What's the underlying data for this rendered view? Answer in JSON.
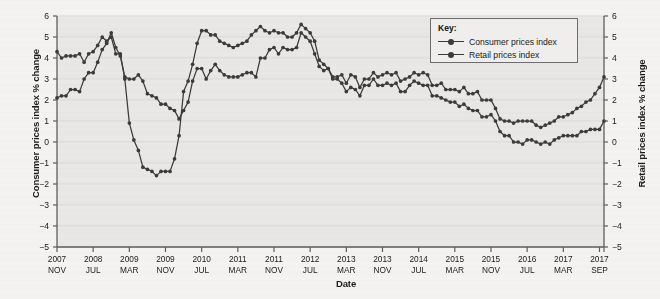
{
  "axes": {
    "y_left_title": "Consumer prices index % change",
    "y_right_title": "Retail prices index % change",
    "x_title": "Date"
  },
  "legend": {
    "title": "Key:",
    "entries": [
      {
        "label": "Consumer prices index"
      },
      {
        "label": "Retail prices index"
      }
    ]
  },
  "colors": {
    "line": "#3b3b3b",
    "plot_background": "#e9e8e6",
    "gridline": "#dcdbd8",
    "axis": "#5e5e5e",
    "text": "#1b1b1b",
    "page_background": "#f4f3f1"
  },
  "chart_data": {
    "type": "line",
    "title": "",
    "xlabel": "Date",
    "ylabel": "Consumer prices index % change",
    "ylabel_right": "Retail prices index % change",
    "ylim": [
      -5,
      6
    ],
    "ytick_values": [
      6,
      5,
      4,
      3,
      2,
      1,
      0,
      -1,
      -2,
      -3,
      -4,
      -5
    ],
    "ytick_labels": [
      "6",
      "5",
      "4",
      "3",
      "2",
      "1",
      "0",
      "−1",
      "−2",
      "−3",
      "−4",
      "−5"
    ],
    "ytick_labels_right": [
      "6",
      "5",
      "4",
      "3",
      "2",
      "1",
      "0",
      "−1",
      "−2",
      "−3",
      "−4",
      "−5"
    ],
    "grid": true,
    "legend_position": "top-right",
    "xtick_labels": [
      {
        "year": "2007",
        "month": "NOV"
      },
      {
        "year": "2008",
        "month": "JUL"
      },
      {
        "year": "2009",
        "month": "MAR"
      },
      {
        "year": "2009",
        "month": "NOV"
      },
      {
        "year": "2010",
        "month": "JUL"
      },
      {
        "year": "2011",
        "month": "MAR"
      },
      {
        "year": "2011",
        "month": "NOV"
      },
      {
        "year": "2012",
        "month": "JUL"
      },
      {
        "year": "2013",
        "month": "MAR"
      },
      {
        "year": "2013",
        "month": "NOV"
      },
      {
        "year": "2014",
        "month": "JUL"
      },
      {
        "year": "2015",
        "month": "MAR"
      },
      {
        "year": "2015",
        "month": "NOV"
      },
      {
        "year": "2016",
        "month": "JUL"
      },
      {
        "year": "2017",
        "month": "MAR"
      },
      {
        "year": "2017",
        "month": "SEP"
      }
    ],
    "x_start": "2007 NOV",
    "x_end": "2017 SEP",
    "x_interval_months": 1,
    "xtick_interval_months": 8,
    "n_points": 119,
    "series": [
      {
        "name": "Consumer prices index",
        "values": [
          2.1,
          2.2,
          2.2,
          2.5,
          2.5,
          2.4,
          3.0,
          3.3,
          3.3,
          3.8,
          4.4,
          4.7,
          5.2,
          4.5,
          4.1,
          3.1,
          3.0,
          3.0,
          3.2,
          2.9,
          2.3,
          2.2,
          2.1,
          1.8,
          1.8,
          1.6,
          1.5,
          1.1,
          1.5,
          1.9,
          2.9,
          3.5,
          3.5,
          3.0,
          3.4,
          3.7,
          3.4,
          3.2,
          3.1,
          3.1,
          3.1,
          3.2,
          3.3,
          3.3,
          3.1,
          4.0,
          4.0,
          4.4,
          4.5,
          4.2,
          4.5,
          4.4,
          4.4,
          4.5,
          5.2,
          5.0,
          4.8,
          4.2,
          3.6,
          3.4,
          3.5,
          3.0,
          3.0,
          2.8,
          2.4,
          2.6,
          2.5,
          2.2,
          2.7,
          2.7,
          3.0,
          2.7,
          2.7,
          2.8,
          2.7,
          2.8,
          2.4,
          2.4,
          2.7,
          2.9,
          2.8,
          2.7,
          2.7,
          2.2,
          2.2,
          2.1,
          2.0,
          1.9,
          1.9,
          1.7,
          1.8,
          1.6,
          1.5,
          1.5,
          1.2,
          1.2,
          1.3,
          1.0,
          0.5,
          0.3,
          0.3,
          0.0,
          0.0,
          -0.1,
          0.1,
          0.1,
          0.0,
          -0.1,
          0.0,
          -0.1,
          0.1,
          0.2,
          0.3,
          0.3,
          0.3,
          0.3,
          0.5,
          0.5,
          0.6,
          0.6,
          0.6,
          1.0
        ]
      },
      {
        "name": "Retail prices index",
        "values": [
          4.3,
          4.0,
          4.1,
          4.1,
          4.1,
          4.2,
          3.8,
          4.2,
          4.3,
          4.6,
          5.0,
          4.8,
          5.0,
          4.2,
          4.2,
          3.0,
          0.9,
          0.1,
          -0.4,
          -1.2,
          -1.3,
          -1.4,
          -1.6,
          -1.4,
          -1.4,
          -1.4,
          -0.8,
          0.3,
          2.4,
          2.9,
          3.7,
          4.7,
          5.3,
          5.3,
          5.1,
          5.1,
          4.8,
          4.7,
          4.6,
          4.5,
          4.6,
          4.7,
          4.8,
          5.1,
          5.3,
          5.5,
          5.3,
          5.2,
          5.3,
          5.2,
          5.2,
          5.0,
          5.0,
          5.2,
          5.6,
          5.4,
          5.2,
          4.8,
          3.9,
          3.7,
          3.5,
          3.1,
          3.1,
          3.2,
          2.8,
          3.2,
          3.1,
          2.6,
          3.0,
          3.0,
          3.3,
          3.1,
          3.2,
          3.3,
          3.2,
          3.3,
          2.9,
          3.0,
          3.1,
          3.3,
          3.2,
          3.3,
          3.2,
          2.7,
          2.7,
          2.8,
          2.5,
          2.5,
          2.5,
          2.4,
          2.6,
          2.3,
          2.3,
          2.4,
          2.0,
          2.0,
          2.0,
          1.6,
          1.1,
          1.0,
          1.0,
          0.9,
          1.0,
          1.0,
          1.0,
          1.0,
          0.8,
          0.7,
          0.8,
          0.9,
          1.0,
          1.2,
          1.2,
          1.3,
          1.4,
          1.6,
          1.7,
          1.9,
          2.0,
          2.3,
          2.6,
          3.1
        ]
      }
    ]
  }
}
